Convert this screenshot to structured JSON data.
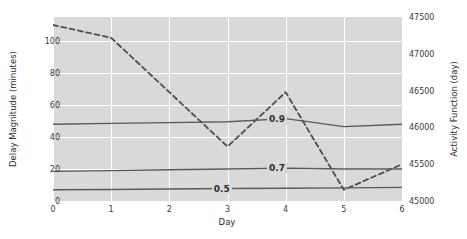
{
  "chart_data": {
    "type": "line",
    "title": "",
    "xlabel": "Day",
    "ylabel": "Delay Magnitude (minutes)",
    "ylabel_right": "Activity Function (day)",
    "xlim": [
      0,
      6
    ],
    "ylim": [
      0,
      115
    ],
    "ylim_right": [
      45000,
      47500
    ],
    "grid": true,
    "legend": null,
    "xticks": [
      "0",
      "1",
      "2",
      "3",
      "4",
      "5",
      "6"
    ],
    "xtick_values": [
      0,
      1,
      2,
      3,
      4,
      5,
      6
    ],
    "yticks": [
      "0",
      "20",
      "40",
      "60",
      "80",
      "100"
    ],
    "ytick_values": [
      0,
      20,
      40,
      60,
      80,
      100
    ],
    "yticks_right": [
      "45000",
      "45500",
      "46000",
      "46500",
      "47000",
      "47500"
    ],
    "ytick_right_values": [
      45000,
      45500,
      46000,
      46500,
      47000,
      47500
    ],
    "x": [
      0,
      1,
      2,
      3,
      4,
      5,
      6
    ],
    "series": [
      {
        "name": "Activity Function",
        "axis": "right",
        "style": "dashed",
        "color": "#4d4d4d",
        "values": [
          47290,
          47045,
          46500,
          45755,
          46405,
          45080,
          45500
        ],
        "values_left_scale": [
          110,
          102,
          68,
          34,
          68,
          7,
          23
        ]
      },
      {
        "name": "0.9",
        "axis": "left",
        "style": "solid",
        "color": "#595959",
        "label": "0.9",
        "label_x": 3.85,
        "values": [
          48,
          48.5,
          49,
          49.5,
          51.5,
          46.5,
          48
        ]
      },
      {
        "name": "0.7",
        "axis": "left",
        "style": "solid",
        "color": "#595959",
        "label": "0.7",
        "label_x": 3.85,
        "values": [
          18.5,
          19,
          19.5,
          20,
          20.5,
          20,
          20
        ]
      },
      {
        "name": "0.5",
        "axis": "left",
        "style": "solid",
        "color": "#595959",
        "label": "0.5",
        "label_x": 2.9,
        "values": [
          7,
          7.2,
          7.5,
          7.8,
          8,
          8.2,
          8.5
        ]
      }
    ],
    "colors": {
      "plot_background": "#d9d9d9",
      "gridline": "#ffffff",
      "dashed_series": "#4d4d4d",
      "solid_series": "#595959",
      "text": "#2d2d2d"
    }
  }
}
